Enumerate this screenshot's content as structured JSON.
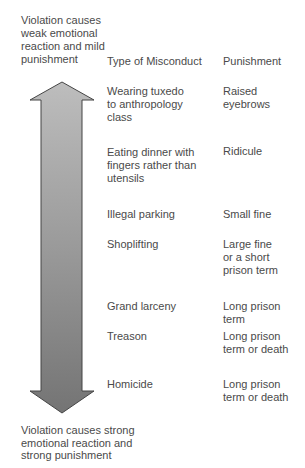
{
  "diagram": {
    "top_label": "Violation causes\nweak emotional\nreaction and mild\npunishment",
    "bottom_label": "Violation causes strong\nemotional reaction and\nstrong punishment",
    "column_headers": {
      "misconduct": "Type of Misconduct",
      "punishment": "Punishment"
    },
    "rows": [
      {
        "misconduct": "Wearing tuxedo\nto anthropology\nclass",
        "punishment": "Raised\neyebrows"
      },
      {
        "misconduct": "Eating dinner with\nfingers rather than\nutensils",
        "punishment": "Ridicule"
      },
      {
        "misconduct": "Illegal parking",
        "punishment": "Small fine"
      },
      {
        "misconduct": "Shoplifting",
        "punishment": "Large fine\nor a short\nprison term"
      },
      {
        "misconduct": "Grand larceny",
        "punishment": "Long prison\nterm"
      },
      {
        "misconduct": "Treason",
        "punishment": "Long prison\nterm or death"
      },
      {
        "misconduct": "Homicide",
        "punishment": "Long prison\nterm or death"
      }
    ],
    "arrow": {
      "icon": "double-headed-vertical-arrow-icon",
      "fill_top": "#bdbdbd",
      "fill_bottom": "#747474",
      "stroke": "#454545"
    }
  }
}
